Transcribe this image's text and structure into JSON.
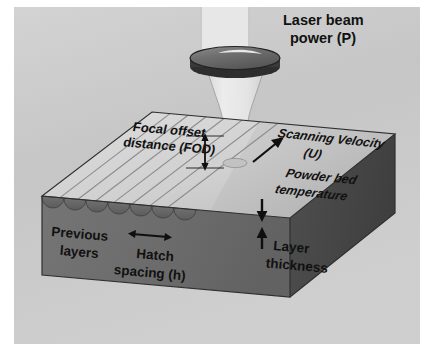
{
  "figure": {
    "background_color": "#c9c9c9",
    "margin_color": "#ffffff"
  },
  "colors": {
    "background": "#c9c9c9",
    "top_surface": "#d2d2d2",
    "top_surface_shadow": "#b4b4b4",
    "front_face": "#6d6d6d",
    "right_face": "#4a4a4a",
    "hatch_line": "#8a8a8a",
    "scallop_fill": "#626262",
    "lens_top": "#6f6f6f",
    "lens_rim": "#2b2b2b",
    "lens_highlight": "#e8e8e8",
    "beam": "#e3e3e3",
    "beam_edge": "#9a9a9a",
    "arrow": "#101010",
    "text": "#111111"
  },
  "labels": {
    "laser_power": {
      "line1": "Laser beam",
      "line2": "power (P)",
      "style": "upright"
    },
    "focal_offset": {
      "line1": "Focal offset",
      "line2": "distance (FOD)",
      "style": "perspective-italic"
    },
    "scanning_velocity": {
      "line1": "Scanning Velocity",
      "line2": "(U)",
      "style": "perspective-italic"
    },
    "powder_bed_temperature": {
      "line1": "Powder bed",
      "line2": "temperature",
      "style": "perspective-italic"
    },
    "previous_layers": {
      "line1": "Previous",
      "line2": "layers",
      "style": "perspective"
    },
    "hatch_spacing": {
      "line1": "Hatch",
      "line2": "spacing (h)",
      "style": "perspective"
    },
    "layer_thickness": {
      "line1": "Layer",
      "line2": "thickness",
      "style": "perspective"
    }
  },
  "annotations": {
    "fod_arrow": "vertical-double-arrow",
    "scan_arrow": "diagonal-arrow-up-right",
    "hatch_arrow": "horizontal-double-arrow",
    "layer_down_arrow": "arrow-down",
    "layer_up_arrow": "arrow-up"
  },
  "geometry": {
    "hatch_track_count": 7,
    "scallop_count": 7,
    "block": "isometric-rectangular-prism",
    "lens": "ellipse-with-rim",
    "beam": "converging-cone-to-cylinder"
  }
}
